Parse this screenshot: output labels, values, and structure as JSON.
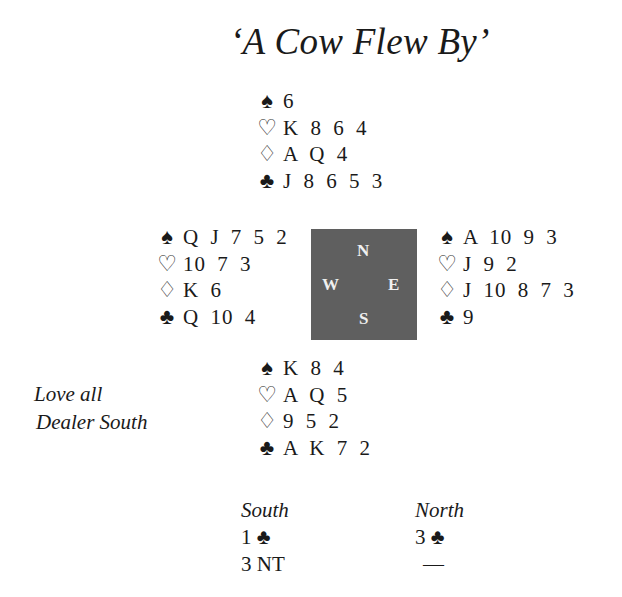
{
  "title": "‘A Cow Flew By’",
  "suit_icons": {
    "spades": "♠",
    "hearts": "♡",
    "diamonds": "♢",
    "clubs": "♣"
  },
  "hands": {
    "north": {
      "spades": "6",
      "hearts": "K 8 6 4",
      "diamonds": "A Q 4",
      "clubs": "J 8 6 5 3"
    },
    "west": {
      "spades": "Q J 7 5 2",
      "hearts": "10 7 3",
      "diamonds": "K 6",
      "clubs": "Q 10 4"
    },
    "east": {
      "spades": "A 10 9 3",
      "hearts": "J 9 2",
      "diamonds": "J 10 8 7 3",
      "clubs": "9"
    },
    "south": {
      "spades": "K 8 4",
      "hearts": "A Q 5",
      "diamonds": "9 5 2",
      "clubs": "A K 7 2"
    }
  },
  "compass": {
    "n": "N",
    "w": "W",
    "e": "E",
    "s": "S",
    "color": "#5f5f5f"
  },
  "deal_info": {
    "vulnerability": "Love all",
    "dealer": "Dealer South"
  },
  "bidding": {
    "south": {
      "header": "South",
      "bids": [
        "1 ♣",
        "3 NT"
      ]
    },
    "north": {
      "header": "North",
      "bids": [
        "3 ♣",
        "—"
      ]
    }
  }
}
